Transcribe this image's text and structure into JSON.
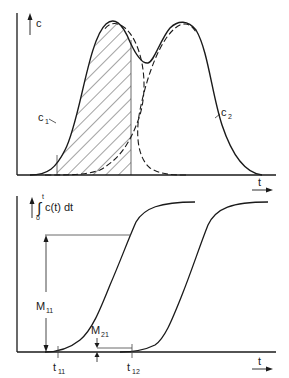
{
  "colors": {
    "background": "#ffffff",
    "ink": "#1a1a1a",
    "thin_line": "#444444"
  },
  "top_panel": {
    "y_axis_label": "c",
    "x_axis_label": "t",
    "curve_labels": {
      "c1": {
        "main": "c",
        "sub": "1"
      },
      "c2": {
        "main": "c",
        "sub": "2"
      }
    },
    "description": "Overlapping peaks c1 and c2 (solid envelope, dashed components), hatched area under c1 between two vertical cut lines"
  },
  "bottom_panel": {
    "y_axis_label": {
      "integral_upper": "t",
      "integral_lower": "o",
      "integral_sign": "∫",
      "integrand": "c(t) dt"
    },
    "x_axis_label": "t",
    "annotations": {
      "M11": {
        "main": "M",
        "sub": "11"
      },
      "M21": {
        "main": "M",
        "sub": "21"
      },
      "t11": {
        "main": "t",
        "sub": "11"
      },
      "t12": {
        "main": "t",
        "sub": "12"
      }
    },
    "description": "Cumulative integral curves (two sigmoids) of the peaks with heights M11 and M21 marked at times t11 and t12"
  }
}
